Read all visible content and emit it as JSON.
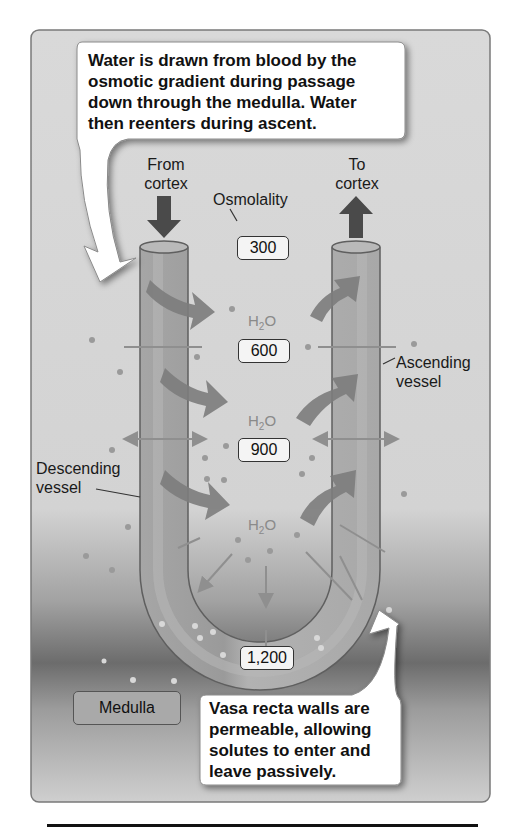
{
  "callouts": {
    "top": {
      "lines": [
        "Water is drawn from blood by the",
        "osmotic gradient during passage",
        "down through the medulla. Water",
        "then reenters during ascent."
      ]
    },
    "bottom": {
      "lines": [
        "Vasa recta walls are",
        "permeable, allowing",
        "solutes to enter and",
        "leave passively."
      ]
    }
  },
  "labels": {
    "from_cortex": [
      "From",
      "cortex"
    ],
    "to_cortex": [
      "To",
      "cortex"
    ],
    "osmolality": "Osmolality",
    "ascending_vessel": [
      "Ascending",
      "vessel"
    ],
    "descending_vessel": [
      "Descending",
      "vessel"
    ],
    "medulla": "Medulla",
    "water": {
      "main": "H",
      "sub": "2",
      "tail": "O"
    }
  },
  "osmolality_values": [
    "300",
    "600",
    "900",
    "1,200"
  ],
  "colors": {
    "panel": "#d6d6d6",
    "panel_band": "#6e6e6e",
    "vessel": "#9e9e9e",
    "vessel_edge": "#5f5f5f",
    "arrow_dark": "#4a4a4a",
    "water_arrow": "#7d7d7d",
    "callout_bg": "#ffffff"
  }
}
